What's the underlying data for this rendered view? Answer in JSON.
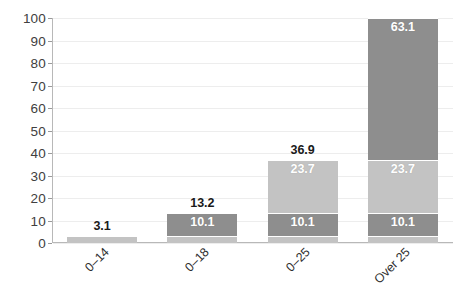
{
  "chart_data": {
    "type": "bar",
    "subtype": "stacked-bar",
    "title": "",
    "xlabel": "",
    "ylabel": "",
    "categories": [
      "0–14",
      "0–18",
      "0–25",
      "Over 25"
    ],
    "series": [
      {
        "name": "segment-1",
        "color": "#c3c3c3",
        "values": [
          3.1,
          3.1,
          3.1,
          3.1
        ]
      },
      {
        "name": "segment-2",
        "color": "#8e8e8e",
        "values": [
          0,
          10.1,
          10.1,
          10.1
        ]
      },
      {
        "name": "segment-3",
        "color": "#c3c3c3",
        "values": [
          0,
          0,
          23.7,
          23.7
        ]
      },
      {
        "name": "segment-4",
        "color": "#8e8e8e",
        "values": [
          0,
          0,
          0,
          63.1
        ]
      }
    ],
    "totals": [
      3.1,
      13.2,
      36.9,
      100.0
    ],
    "total_labels": [
      "3.1",
      "13.2",
      "36.9",
      ""
    ],
    "ylim": [
      0,
      100
    ],
    "yticks": [
      0,
      10,
      20,
      30,
      40,
      50,
      60,
      70,
      80,
      90,
      100
    ],
    "ytick_labels": [
      "0",
      "10",
      "20",
      "30",
      "40",
      "50",
      "60",
      "70",
      "80",
      "90",
      "100"
    ],
    "grid": true,
    "legend": "none",
    "bar_value_labels": [
      {
        "category": "0–14",
        "labels": []
      },
      {
        "category": "0–18",
        "labels": [
          "10.1"
        ]
      },
      {
        "category": "0–25",
        "labels": [
          "10.1",
          "23.7"
        ]
      },
      {
        "category": "Over 25",
        "labels": [
          "10.1",
          "23.7",
          "63.1"
        ]
      }
    ]
  },
  "colors": {
    "light_gray": "#c3c3c3",
    "dark_gray": "#8e8e8e",
    "gridline": "#ededed",
    "axis": "#b8b8b8",
    "text": "#2f2f2f",
    "value_text": "#ffffff",
    "background": "#ffffff"
  }
}
